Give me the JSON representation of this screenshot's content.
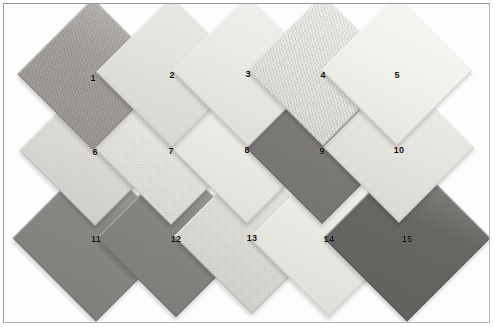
{
  "figure": {
    "width": 495,
    "height": 327,
    "background": "#ffffff",
    "frame_color": "#9a9a9a",
    "tile_size": 107,
    "rotation_deg": 45
  },
  "tiles": [
    {
      "label": "1",
      "color": "#aaa7a3",
      "cx": 93,
      "cy": 74,
      "size": 107,
      "texture": "coarse",
      "z": 31,
      "num_dx": 0,
      "num_dy": 4
    },
    {
      "label": "2",
      "color": "#e6e4df",
      "cx": 172,
      "cy": 72,
      "size": 107,
      "texture": "fine",
      "z": 32,
      "num_dx": 0,
      "num_dy": 3
    },
    {
      "label": "3",
      "color": "#edece8",
      "cx": 248,
      "cy": 71,
      "size": 107,
      "texture": "fine",
      "z": 33,
      "num_dx": 0,
      "num_dy": 3
    },
    {
      "label": "4",
      "color": "#f0efeb",
      "cx": 323,
      "cy": 70,
      "size": 107,
      "texture": "coarse",
      "z": 34,
      "num_dx": 0,
      "num_dy": 5
    },
    {
      "label": "5",
      "color": "#f5f4f1",
      "cx": 397,
      "cy": 70,
      "size": 107,
      "texture": "fine",
      "z": 35,
      "num_dx": 0,
      "num_dy": 5
    },
    {
      "label": "6",
      "color": "#e2e1dc",
      "cx": 95,
      "cy": 150,
      "size": 107,
      "texture": "normal",
      "z": 21,
      "num_dx": 0,
      "num_dy": 2
    },
    {
      "label": "7",
      "color": "#eceae6",
      "cx": 171,
      "cy": 149,
      "size": 107,
      "texture": "normal",
      "z": 22,
      "num_dx": 0,
      "num_dy": 2
    },
    {
      "label": "8",
      "color": "#efeeea",
      "cx": 247,
      "cy": 148,
      "size": 107,
      "texture": "fine",
      "z": 23,
      "num_dx": 0,
      "num_dy": 2
    },
    {
      "label": "9",
      "color": "#807e7b",
      "cx": 322,
      "cy": 148,
      "size": 107,
      "texture": "normal",
      "z": 24,
      "num_dx": 0,
      "num_dy": 3
    },
    {
      "label": "10",
      "color": "#e9e7e2",
      "cx": 399,
      "cy": 147,
      "size": 107,
      "texture": "fine",
      "z": 25,
      "num_dx": 0,
      "num_dy": 3
    },
    {
      "label": "11",
      "color": "#8c8a87",
      "cx": 96,
      "cy": 238,
      "size": 118,
      "texture": "normal",
      "z": 11,
      "num_dx": 0,
      "num_dy": 1
    },
    {
      "label": "12",
      "color": "#8a8885",
      "cx": 176,
      "cy": 238,
      "size": 112,
      "texture": "normal",
      "z": 12,
      "num_dx": 0,
      "num_dy": 1
    },
    {
      "label": "13",
      "color": "#e3e1dc",
      "cx": 252,
      "cy": 236,
      "size": 110,
      "texture": "normal",
      "z": 13,
      "num_dx": 0,
      "num_dy": 2
    },
    {
      "label": "14",
      "color": "#eeece7",
      "cx": 329,
      "cy": 238,
      "size": 112,
      "texture": "fine",
      "z": 14,
      "num_dx": 0,
      "num_dy": 1
    },
    {
      "label": "15",
      "color": "#6b6966",
      "cx": 407,
      "cy": 238,
      "size": 118,
      "texture": "normal",
      "z": 15,
      "num_dx": 0,
      "num_dy": 1
    }
  ]
}
